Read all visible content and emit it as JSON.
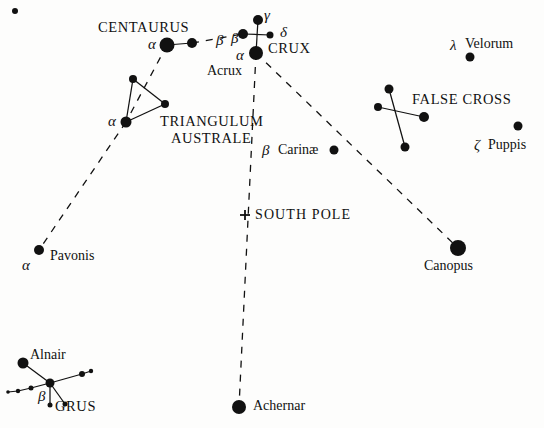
{
  "chart": {
    "type": "scatter",
    "width": 544,
    "height": 428,
    "background_color": "#fdfdfc",
    "ink_color": "#111111"
  },
  "chart_data": {
    "type": "scatter",
    "xlabel": "",
    "ylabel": "",
    "xlim": [
      0,
      544
    ],
    "ylim": [
      0,
      428
    ],
    "grid": false,
    "legend": "none",
    "note": "Star positions are pixel coordinates in the image; radius encodes apparent brightness.",
    "stars": [
      {
        "name": "corner-dot",
        "x": 15,
        "y": 11,
        "r": 3.0,
        "label": ""
      },
      {
        "name": "alpha-centauri",
        "x": 167,
        "y": 45,
        "r": 7.5,
        "label": "α"
      },
      {
        "name": "beta-centauri",
        "x": 192,
        "y": 43,
        "r": 5.0,
        "label": "β"
      },
      {
        "name": "beta-crux",
        "x": 243,
        "y": 34,
        "r": 5.0,
        "label": "β"
      },
      {
        "name": "gamma-crux",
        "x": 258,
        "y": 20,
        "r": 5.0,
        "label": "γ"
      },
      {
        "name": "delta-crux",
        "x": 270,
        "y": 35,
        "r": 3.5,
        "label": "δ"
      },
      {
        "name": "alpha-crux-acrux",
        "x": 256,
        "y": 53,
        "r": 7.0,
        "label": "α"
      },
      {
        "name": "triangulum-top",
        "x": 133,
        "y": 79,
        "r": 4.0,
        "label": ""
      },
      {
        "name": "triangulum-right",
        "x": 165,
        "y": 104,
        "r": 4.0,
        "label": ""
      },
      {
        "name": "alpha-trianguli-australis",
        "x": 126,
        "y": 122,
        "r": 5.5,
        "label": "α"
      },
      {
        "name": "beta-carinae",
        "x": 334,
        "y": 150,
        "r": 4.5,
        "label": ""
      },
      {
        "name": "false-cross-top",
        "x": 389,
        "y": 89,
        "r": 4.5,
        "label": ""
      },
      {
        "name": "false-cross-left",
        "x": 378,
        "y": 107,
        "r": 4.0,
        "label": ""
      },
      {
        "name": "false-cross-right",
        "x": 424,
        "y": 117,
        "r": 5.0,
        "label": ""
      },
      {
        "name": "false-cross-bottom",
        "x": 405,
        "y": 147,
        "r": 4.5,
        "label": ""
      },
      {
        "name": "lambda-velorum",
        "x": 470,
        "y": 57,
        "r": 4.5,
        "label": "λ"
      },
      {
        "name": "zeta-puppis",
        "x": 518,
        "y": 126,
        "r": 4.5,
        "label": "ζ"
      },
      {
        "name": "canopus",
        "x": 458,
        "y": 248,
        "r": 8.0,
        "label": ""
      },
      {
        "name": "alpha-pavonis",
        "x": 39,
        "y": 250,
        "r": 5.0,
        "label": "α"
      },
      {
        "name": "achernar",
        "x": 239,
        "y": 407,
        "r": 7.0,
        "label": ""
      },
      {
        "name": "alnair",
        "x": 23,
        "y": 363,
        "r": 5.5,
        "label": ""
      },
      {
        "name": "grus-center",
        "x": 50,
        "y": 383,
        "r": 4.5,
        "label": ""
      },
      {
        "name": "grus-upper-right",
        "x": 82,
        "y": 374,
        "r": 3.0,
        "label": ""
      },
      {
        "name": "grus-right-tip",
        "x": 91,
        "y": 371,
        "r": 2.2,
        "label": ""
      },
      {
        "name": "grus-left-1",
        "x": 31,
        "y": 388,
        "r": 2.5,
        "label": ""
      },
      {
        "name": "grus-left-2",
        "x": 18,
        "y": 391,
        "r": 2.2,
        "label": ""
      },
      {
        "name": "grus-left-3",
        "x": 8,
        "y": 392,
        "r": 1.8,
        "label": ""
      },
      {
        "name": "grus-leg-left",
        "x": 50,
        "y": 405,
        "r": 2.5,
        "label": ""
      },
      {
        "name": "grus-leg-right",
        "x": 65,
        "y": 404,
        "r": 2.5,
        "label": ""
      }
    ],
    "solid_lines": [
      {
        "name": "centaurus-alpha-beta",
        "from": "alpha-centauri",
        "to": "beta-centauri"
      },
      {
        "name": "crux-vertical",
        "from": "gamma-crux",
        "to": "alpha-crux-acrux"
      },
      {
        "name": "crux-horizontal",
        "from": "beta-crux",
        "to": "delta-crux"
      },
      {
        "name": "triangulum-left-side",
        "from": "triangulum-top",
        "to": "alpha-trianguli-australis"
      },
      {
        "name": "triangulum-top-side",
        "from": "triangulum-top",
        "to": "triangulum-right"
      },
      {
        "name": "triangulum-bottom-side",
        "from": "alpha-trianguli-australis",
        "to": "triangulum-right"
      },
      {
        "name": "false-cross-diagonal-1",
        "from": "false-cross-top",
        "to": "false-cross-bottom"
      },
      {
        "name": "false-cross-diagonal-2",
        "from": "false-cross-left",
        "to": "false-cross-right"
      },
      {
        "name": "grus-alnair-link",
        "from": "alnair",
        "to": "grus-center"
      },
      {
        "name": "grus-right-arm",
        "from": "grus-center",
        "to": "grus-upper-right"
      },
      {
        "name": "grus-right-tip-link",
        "from": "grus-upper-right",
        "to": "grus-right-tip"
      },
      {
        "name": "grus-left-arm",
        "from": "grus-center",
        "to": "grus-left-1"
      },
      {
        "name": "grus-left-arm-2",
        "from": "grus-left-1",
        "to": "grus-left-2"
      },
      {
        "name": "grus-left-arm-3",
        "from": "grus-left-2",
        "to": "grus-left-3"
      },
      {
        "name": "grus-leg-1",
        "from": "grus-center",
        "to": "grus-leg-left"
      },
      {
        "name": "grus-leg-2",
        "from": "grus-center",
        "to": "grus-leg-right"
      }
    ],
    "dashed_lines": [
      {
        "name": "centaurus-to-crux-pointer",
        "from": "beta-centauri",
        "to": "beta-crux"
      },
      {
        "name": "centaurus-to-triangulum",
        "from": "alpha-centauri",
        "to": "alpha-trianguli-australis"
      },
      {
        "name": "triangulum-to-pavonis",
        "from": "alpha-trianguli-australis",
        "to": "alpha-pavonis"
      },
      {
        "name": "acrux-to-achernar-south-pole-line",
        "from": "alpha-crux-acrux",
        "to": "achernar"
      },
      {
        "name": "acrux-to-canopus",
        "from": "alpha-crux-acrux",
        "to": "canopus"
      }
    ],
    "markers": [
      {
        "name": "south-pole-cross",
        "x": 245,
        "y": 215,
        "symbol": "+"
      }
    ]
  },
  "labels": {
    "constellations": [
      {
        "name": "centaurus",
        "text": "CENTAURUS",
        "x": 98,
        "y": 20
      },
      {
        "name": "crux",
        "text": "CRUX",
        "x": 268,
        "y": 41
      },
      {
        "name": "triangulum-australe-line1",
        "text": "TRIANGULUM",
        "x": 160,
        "y": 114
      },
      {
        "name": "triangulum-australe-line2",
        "text": "AUSTRALE",
        "x": 171,
        "y": 131
      },
      {
        "name": "false-cross",
        "text": "FALSE CROSS",
        "x": 412,
        "y": 92
      },
      {
        "name": "grus",
        "text": "GRUS",
        "x": 55,
        "y": 399
      }
    ],
    "stars": [
      {
        "name": "acrux",
        "text": "Acrux",
        "x": 207,
        "y": 64
      },
      {
        "name": "velorum",
        "text": "Velorum",
        "x": 465,
        "y": 37
      },
      {
        "name": "puppis",
        "text": "Puppis",
        "x": 488,
        "y": 138
      },
      {
        "name": "carinae",
        "text": "Carinæ",
        "x": 278,
        "y": 143
      },
      {
        "name": "pavonis",
        "text": "Pavonis",
        "x": 50,
        "y": 249
      },
      {
        "name": "canopus",
        "text": "Canopus",
        "x": 424,
        "y": 259
      },
      {
        "name": "achernar",
        "text": "Achernar",
        "x": 253,
        "y": 399
      },
      {
        "name": "alnair",
        "text": "Alnair",
        "x": 30,
        "y": 348
      }
    ],
    "greek": [
      {
        "name": "alpha-centauri-label",
        "text": "α",
        "x": 148,
        "y": 37
      },
      {
        "name": "beta-centauri-label",
        "text": "β",
        "x": 216,
        "y": 33
      },
      {
        "name": "beta-crux-label",
        "text": "β",
        "x": 231,
        "y": 31
      },
      {
        "name": "gamma-crux-label",
        "text": "γ",
        "x": 264,
        "y": 8
      },
      {
        "name": "delta-crux-label",
        "text": "δ",
        "x": 280,
        "y": 25
      },
      {
        "name": "alpha-crux-label",
        "text": "α",
        "x": 236,
        "y": 48
      },
      {
        "name": "alpha-trianguli-label",
        "text": "α",
        "x": 108,
        "y": 114
      },
      {
        "name": "beta-carinae-label",
        "text": "β",
        "x": 262,
        "y": 143
      },
      {
        "name": "lambda-velorum-label",
        "text": "λ",
        "x": 450,
        "y": 38
      },
      {
        "name": "zeta-puppis-label",
        "text": "ζ",
        "x": 474,
        "y": 138
      },
      {
        "name": "alpha-pavonis-label",
        "text": "α",
        "x": 22,
        "y": 258
      },
      {
        "name": "beta-grus-label",
        "text": "β",
        "x": 38,
        "y": 389
      }
    ],
    "markers": [
      {
        "name": "south-pole",
        "text": "SOUTH POLE",
        "x": 255,
        "y": 208
      }
    ]
  }
}
